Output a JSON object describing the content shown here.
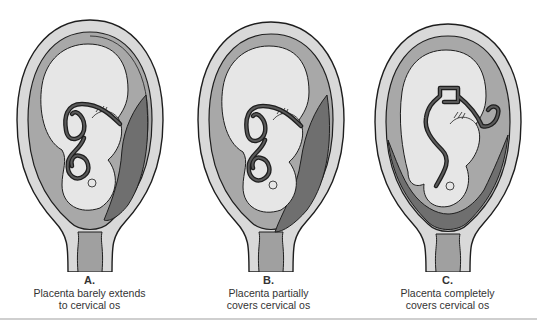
{
  "figure": {
    "panels": [
      {
        "id": "A",
        "letter": "A.",
        "caption_line1": "Placenta barely extends",
        "caption_line2": "to cervical os",
        "placenta_position": "low-lying, margin reaches cervical os"
      },
      {
        "id": "B",
        "letter": "B.",
        "caption_line1": "Placenta partially",
        "caption_line2": "covers cervical os",
        "placenta_position": "partial previa"
      },
      {
        "id": "C",
        "letter": "C.",
        "caption_line1": "Placenta completely",
        "caption_line2": "covers cervical os",
        "placenta_position": "complete previa"
      }
    ],
    "colors": {
      "uterine_wall": "#d9d9d9",
      "amniotic_fluid": "#a8a8a8",
      "fetus": "#e6e6e6",
      "placenta": "#6f6f6f",
      "cord": "#5a5a5a",
      "outline": "#1e1e1e",
      "cervix_canal": "#a0a0a0"
    },
    "footer_partial": "Figure caption (cut off)"
  }
}
